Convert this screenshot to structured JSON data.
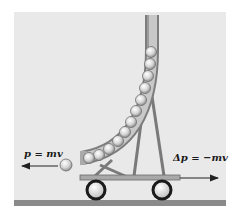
{
  "figure": {
    "colors": {
      "background_panel": "#e9e9e9",
      "ground": "#8a8a8a",
      "tube": "#9a9a9a",
      "ball": "#d8d8d8",
      "wheel_rim": "#1a1a1a",
      "arrow": "#222222"
    }
  },
  "labels": {
    "ball_momentum": "p = mv",
    "cart_momentum_change": "Δp = −mv"
  },
  "elements": {
    "balls_in_tube_count": 12,
    "ejected_ball_count": 1,
    "wheels_count": 2
  }
}
